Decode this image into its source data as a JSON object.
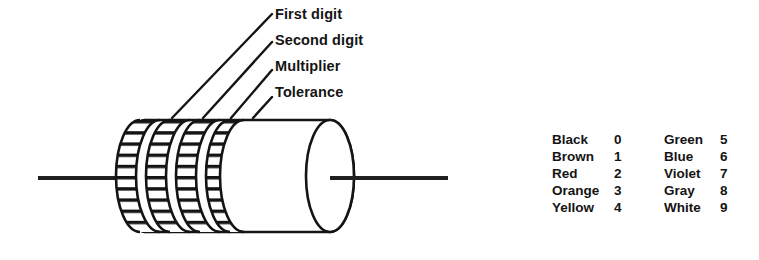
{
  "figure": {
    "ink_color": "#141414",
    "background_color": "#ffffff"
  },
  "callouts": [
    {
      "label": "First digit",
      "band_index": 1
    },
    {
      "label": "Second digit",
      "band_index": 2
    },
    {
      "label": "Multiplier",
      "band_index": 3
    },
    {
      "label": "Tolerance",
      "band_index": 4
    }
  ],
  "resistor": {
    "band_count": 4,
    "lead_count": 2
  },
  "color_table": {
    "rows": [
      {
        "left_color": "Black",
        "left_digit": "0",
        "right_color": "Green",
        "right_digit": "5"
      },
      {
        "left_color": "Brown",
        "left_digit": "1",
        "right_color": "Blue",
        "right_digit": "6"
      },
      {
        "left_color": "Red",
        "left_digit": "2",
        "right_color": "Violet",
        "right_digit": "7"
      },
      {
        "left_color": "Orange",
        "left_digit": "3",
        "right_color": "Gray",
        "right_digit": "8"
      },
      {
        "left_color": "Yellow",
        "left_digit": "4",
        "right_color": "White",
        "right_digit": "9"
      }
    ]
  }
}
